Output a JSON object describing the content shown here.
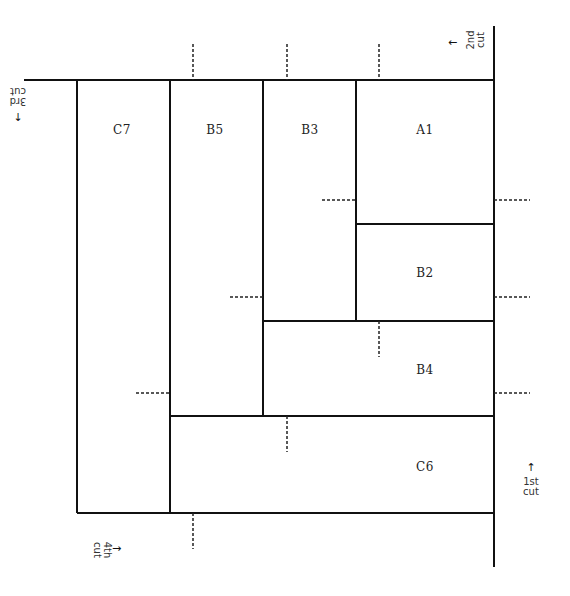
{
  "diagram": {
    "type": "cutting-layout",
    "line_color": "#111111",
    "dash_color": "#222222",
    "panels": [
      {
        "id": "C7",
        "label": "C7",
        "x": 77,
        "y": 80,
        "w": 93,
        "h": 433
      },
      {
        "id": "B5",
        "label": "B5",
        "x": 170,
        "y": 80,
        "w": 93,
        "h": 336
      },
      {
        "id": "B3",
        "label": "B3",
        "x": 263,
        "y": 80,
        "w": 93,
        "h": 241
      },
      {
        "id": "A1",
        "label": "A1",
        "x": 356,
        "y": 80,
        "w": 138,
        "h": 144
      },
      {
        "id": "B2",
        "label": "B2",
        "x": 356,
        "y": 224,
        "w": 138,
        "h": 97
      },
      {
        "id": "B4",
        "label": "B4",
        "x": 263,
        "y": 321,
        "w": 231,
        "h": 95
      },
      {
        "id": "C6",
        "label": "C6",
        "x": 170,
        "y": 416,
        "w": 324,
        "h": 97
      }
    ],
    "label_positions": {
      "C7": {
        "x": 122,
        "y": 130
      },
      "B5": {
        "x": 215,
        "y": 130
      },
      "B3": {
        "x": 310,
        "y": 130
      },
      "A1": {
        "x": 425,
        "y": 130
      },
      "B2": {
        "x": 425,
        "y": 273
      },
      "B4": {
        "x": 425,
        "y": 370
      },
      "C6": {
        "x": 425,
        "y": 467
      }
    },
    "cuts": [
      {
        "id": "cut-1",
        "line1": "1st",
        "line2": "cut",
        "arrow": "↑",
        "rotation": 0,
        "x": 530,
        "y": 465
      },
      {
        "id": "cut-2",
        "line1": "2nd",
        "line2": "cut",
        "arrow": "←",
        "rotation": -90,
        "x": 470,
        "y": 40
      },
      {
        "id": "cut-3",
        "line1": "3rd",
        "line2": "cut",
        "arrow": "↓",
        "rotation": 180,
        "x": 18,
        "y": 95
      },
      {
        "id": "cut-4",
        "line1": "4th",
        "line2": "cut",
        "arrow": "→",
        "rotation": 90,
        "x": 102,
        "y": 548
      }
    ]
  }
}
